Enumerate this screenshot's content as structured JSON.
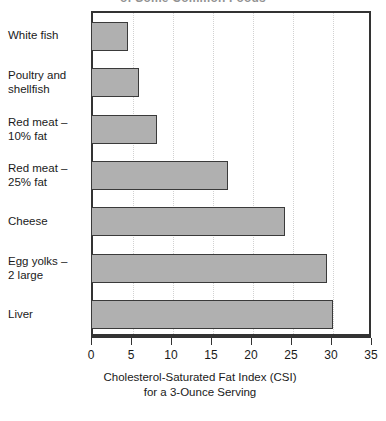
{
  "chart_data": {
    "type": "bar",
    "orientation": "horizontal",
    "title": "of Some Common Foods",
    "title_clipped": true,
    "categories": [
      "White fish",
      "Poultry and shellfish",
      "Red meat  – 10% fat",
      "Red meat – 25% fat",
      "Cheese",
      "Egg yolks – 2 large",
      "Liver"
    ],
    "category_lines": [
      [
        "White fish"
      ],
      [
        "Poultry and",
        "shellfish"
      ],
      [
        "Red meat  –",
        "10% fat"
      ],
      [
        "Red meat –",
        "25% fat"
      ],
      [
        "Cheese"
      ],
      [
        "Egg yolks –",
        "2 large"
      ],
      [
        "Liver"
      ]
    ],
    "values": [
      4.6,
      6.0,
      8.2,
      17.1,
      24.3,
      29.5,
      30.3
    ],
    "xlabel": "Cholesterol-Saturated Fat Index (CSI)",
    "xlabel_line2": "for a 3-Ounce Serving",
    "ylabel": "",
    "xlim": [
      0,
      35
    ],
    "xticks": [
      0,
      5,
      10,
      15,
      20,
      25,
      30,
      35
    ],
    "xtick_labels": [
      "0",
      "5",
      "10",
      "15",
      "20",
      "25",
      "30",
      "35"
    ],
    "grid": true,
    "grid_axis": "x",
    "grid_style": "dotted",
    "legend": false,
    "bar_color": "#b0b0b0",
    "bar_edge_color": "#3a3a3a",
    "frame_color": "#333333",
    "grid_color": "#d2d2d2",
    "background": "#ffffff"
  }
}
